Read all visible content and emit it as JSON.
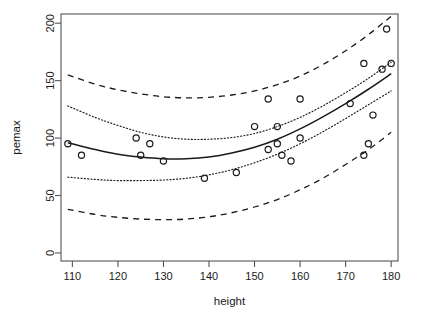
{
  "chart_data": {
    "type": "scatter",
    "title": "",
    "xlabel": "height",
    "ylabel": "pemax",
    "xlim": [
      107.5,
      181.5
    ],
    "ylim": [
      -7,
      208
    ],
    "grid": false,
    "legend": null,
    "xticks": [
      110,
      120,
      130,
      140,
      150,
      160,
      170,
      180
    ],
    "yticks": [
      0,
      50,
      100,
      150,
      200
    ],
    "points": [
      {
        "x": 109,
        "y": 95
      },
      {
        "x": 112,
        "y": 85
      },
      {
        "x": 124,
        "y": 100
      },
      {
        "x": 125,
        "y": 85
      },
      {
        "x": 127,
        "y": 95
      },
      {
        "x": 130,
        "y": 80
      },
      {
        "x": 139,
        "y": 65
      },
      {
        "x": 146,
        "y": 70
      },
      {
        "x": 150,
        "y": 110
      },
      {
        "x": 153,
        "y": 134
      },
      {
        "x": 153,
        "y": 90
      },
      {
        "x": 155,
        "y": 110
      },
      {
        "x": 155,
        "y": 95
      },
      {
        "x": 156,
        "y": 85
      },
      {
        "x": 158,
        "y": 80
      },
      {
        "x": 160,
        "y": 134
      },
      {
        "x": 160,
        "y": 100
      },
      {
        "x": 171,
        "y": 130
      },
      {
        "x": 174,
        "y": 165
      },
      {
        "x": 174,
        "y": 85
      },
      {
        "x": 175,
        "y": 95
      },
      {
        "x": 176,
        "y": 120
      },
      {
        "x": 178,
        "y": 160
      },
      {
        "x": 179,
        "y": 195
      },
      {
        "x": 180,
        "y": 165
      }
    ],
    "series": [
      {
        "name": "fitted-curve",
        "style": "solid",
        "x": [
          109,
          115,
          120,
          125,
          130,
          135,
          140,
          145,
          150,
          155,
          160,
          165,
          170,
          175,
          180
        ],
        "y": [
          96,
          90,
          86,
          83.5,
          82,
          82,
          83.5,
          87,
          92,
          99,
          108,
          118.5,
          130,
          142.5,
          156
        ]
      },
      {
        "name": "confidence-upper",
        "style": "dotted",
        "x": [
          109,
          115,
          120,
          125,
          130,
          135,
          140,
          145,
          150,
          155,
          160,
          165,
          170,
          175,
          180
        ],
        "y": [
          128,
          118,
          111,
          105,
          101,
          99,
          99,
          100.5,
          104,
          110,
          118,
          128,
          139.5,
          152,
          166
        ]
      },
      {
        "name": "confidence-lower",
        "style": "dotted",
        "x": [
          109,
          115,
          120,
          125,
          130,
          135,
          140,
          145,
          150,
          155,
          160,
          165,
          170,
          175,
          180
        ],
        "y": [
          66,
          64,
          63,
          63,
          63.5,
          65,
          68,
          72.5,
          78.5,
          86,
          95,
          105.5,
          117,
          129,
          141
        ]
      },
      {
        "name": "prediction-upper",
        "style": "dashed",
        "x": [
          109,
          115,
          120,
          125,
          130,
          135,
          140,
          145,
          150,
          155,
          160,
          165,
          170,
          175,
          180
        ],
        "y": [
          155,
          147,
          142,
          138.5,
          136,
          135,
          135.5,
          137.5,
          141,
          146.5,
          154,
          164,
          176,
          190,
          206
        ]
      },
      {
        "name": "prediction-lower",
        "style": "dashed",
        "x": [
          109,
          115,
          120,
          125,
          130,
          135,
          140,
          145,
          150,
          155,
          160,
          165,
          170,
          175,
          180
        ],
        "y": [
          38,
          33.5,
          31,
          29.5,
          29,
          29.5,
          31.5,
          35,
          40,
          46.5,
          55,
          65,
          77,
          90,
          105
        ]
      }
    ]
  }
}
